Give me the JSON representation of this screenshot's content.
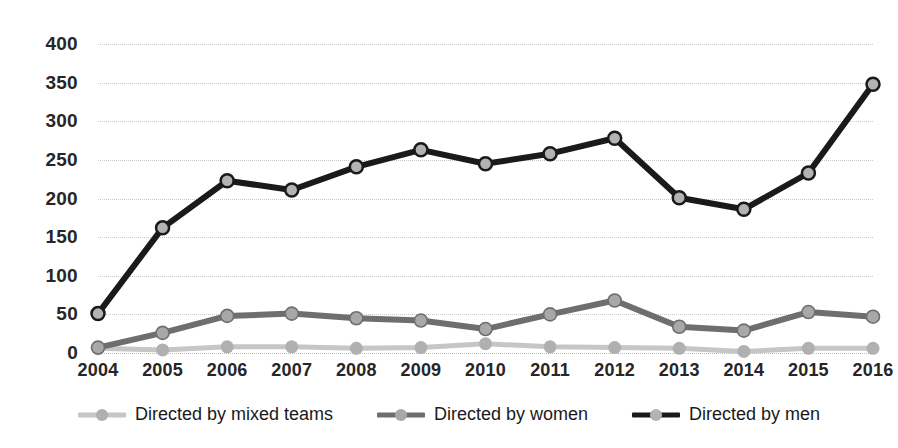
{
  "chart_data": {
    "type": "line",
    "title": "",
    "subtitle": "",
    "xlabel": "",
    "ylabel": "",
    "categories": [
      "2004",
      "2005",
      "2006",
      "2007",
      "2008",
      "2009",
      "2010",
      "2011",
      "2012",
      "2013",
      "2014",
      "2015",
      "2016"
    ],
    "ylim": [
      0,
      400
    ],
    "y_ticks": [
      0,
      50,
      100,
      150,
      200,
      250,
      300,
      350,
      400
    ],
    "grid": true,
    "grid_style": "horizontal-dotted",
    "legend_position": "bottom",
    "series": [
      {
        "name": "Directed by mixed teams",
        "color": "#c6c6c6",
        "marker": "circle",
        "values": [
          6,
          4,
          8,
          8,
          6,
          7,
          12,
          8,
          7,
          6,
          2,
          6,
          6
        ]
      },
      {
        "name": "Directed by women",
        "color": "#6e6e6e",
        "marker": "circle",
        "values": [
          7,
          26,
          48,
          51,
          45,
          42,
          31,
          50,
          68,
          34,
          29,
          53,
          47
        ]
      },
      {
        "name": "Directed by men",
        "color": "#1a1a1a",
        "marker": "circle",
        "values": [
          51,
          162,
          223,
          211,
          241,
          263,
          245,
          258,
          278,
          201,
          186,
          233,
          348
        ]
      }
    ]
  },
  "legend": {
    "items": [
      {
        "label": "Directed by mixed teams",
        "color": "#c6c6c6"
      },
      {
        "label": "Directed by women",
        "color": "#6e6e6e"
      },
      {
        "label": "Directed by men",
        "color": "#1a1a1a"
      }
    ]
  },
  "colors": {
    "background": "#ffffff",
    "gridline": "#c9c9c9",
    "axis_text": "#262626",
    "mixed_teams": "#c6c6c6",
    "women": "#6e6e6e",
    "men": "#1a1a1a"
  }
}
